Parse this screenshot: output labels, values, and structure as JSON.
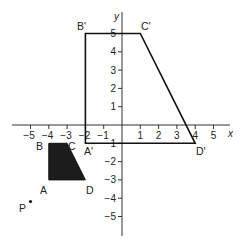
{
  "diagram": {
    "type": "coordinate-plane-enlargement",
    "axes": {
      "x_label": "x",
      "y_label": "y",
      "x_ticks": [
        -5,
        -4,
        -3,
        -2,
        -1,
        1,
        2,
        3,
        4,
        5
      ],
      "y_ticks": [
        5,
        4,
        3,
        2,
        1,
        -1,
        -2,
        -3,
        -4,
        -5
      ],
      "x_range": [
        -6,
        6
      ],
      "y_range": [
        -6,
        6
      ]
    },
    "shapes": [
      {
        "name": "ABCD",
        "filled": true,
        "fill_color": "#1c1c1c",
        "vertices": [
          {
            "label": "A",
            "x": -4,
            "y": -3
          },
          {
            "label": "B",
            "x": -4,
            "y": -1
          },
          {
            "label": "C",
            "x": -3,
            "y": -1
          },
          {
            "label": "D",
            "x": -2,
            "y": -3
          }
        ]
      },
      {
        "name": "A'B'C'D'",
        "filled": false,
        "stroke_color": "#111111",
        "vertices": [
          {
            "label": "A'",
            "x": -2,
            "y": -1
          },
          {
            "label": "B'",
            "x": -2,
            "y": 5
          },
          {
            "label": "C'",
            "x": 1,
            "y": 5
          },
          {
            "label": "D'",
            "x": 4,
            "y": -1
          }
        ]
      }
    ],
    "points": [
      {
        "label": "P",
        "x": -5,
        "y": -4.2
      }
    ]
  },
  "labels": {
    "A": "A",
    "B": "B",
    "C": "C",
    "D": "D",
    "A_prime": "A'",
    "B_prime": "B'",
    "C_prime": "C'",
    "D_prime": "D'",
    "P": "P",
    "x_axis": "x",
    "y_axis": "y",
    "xt_m5": "−5",
    "xt_m4": "−4",
    "xt_m3": "−3",
    "xt_m2": "−2",
    "xt_m1": "−1",
    "xt_1": "1",
    "xt_2": "2",
    "xt_3": "3",
    "xt_4": "4",
    "xt_5": "5",
    "yt_5": "5",
    "yt_4": "4",
    "yt_3": "3",
    "yt_2": "2",
    "yt_1": "1",
    "yt_m1": "−1",
    "yt_m2": "−2",
    "yt_m3": "−3",
    "yt_m4": "−4",
    "yt_m5": "−5"
  }
}
